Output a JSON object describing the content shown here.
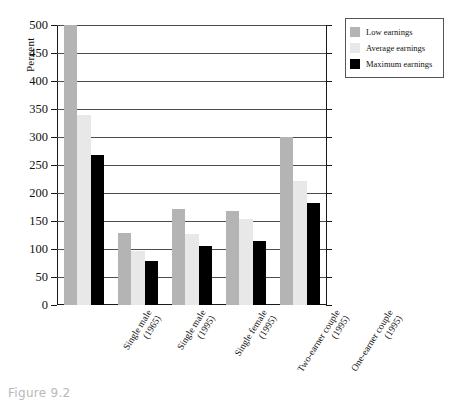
{
  "caption": "Figure 9.2",
  "chart_data": {
    "type": "bar",
    "title": "",
    "xlabel": "",
    "ylabel": "Percent",
    "ylim": [
      0,
      500
    ],
    "ytick_step": 50,
    "ytick_labels": [
      "0",
      "50",
      "100",
      "150",
      "200",
      "250",
      "300",
      "350",
      "400",
      "450",
      "500"
    ],
    "grid": true,
    "grid_axis": "y",
    "legend_position": "top-right",
    "categories": [
      "Single male (1965)",
      "Single male (1995)",
      "Single female (1995)",
      "Two-earner couple (1995)",
      "One-earner couple (1995)"
    ],
    "category_lines": [
      [
        "Single male",
        "(1965)"
      ],
      [
        "Single male",
        "(1995)"
      ],
      [
        "Single female",
        "(1995)"
      ],
      [
        "Two-earner couple",
        "(1995)"
      ],
      [
        "One-earner couple",
        "(1995)"
      ]
    ],
    "series": [
      {
        "name": "Low earnings",
        "color": "#b4b4b4",
        "values": [
          500,
          129,
          172,
          168,
          300
        ]
      },
      {
        "name": "Average earnings",
        "color": "#e8e8e8",
        "values": [
          340,
          97,
          126,
          154,
          221
        ]
      },
      {
        "name": "Maximum earnings",
        "color": "#000000",
        "values": [
          267,
          79,
          105,
          115,
          182
        ]
      }
    ]
  },
  "legend": {
    "items": [
      {
        "label": "Low earnings",
        "color": "#b4b4b4"
      },
      {
        "label": "Average earnings",
        "color": "#e8e8e8"
      },
      {
        "label": "Maximum earnings",
        "color": "#000000"
      }
    ]
  }
}
